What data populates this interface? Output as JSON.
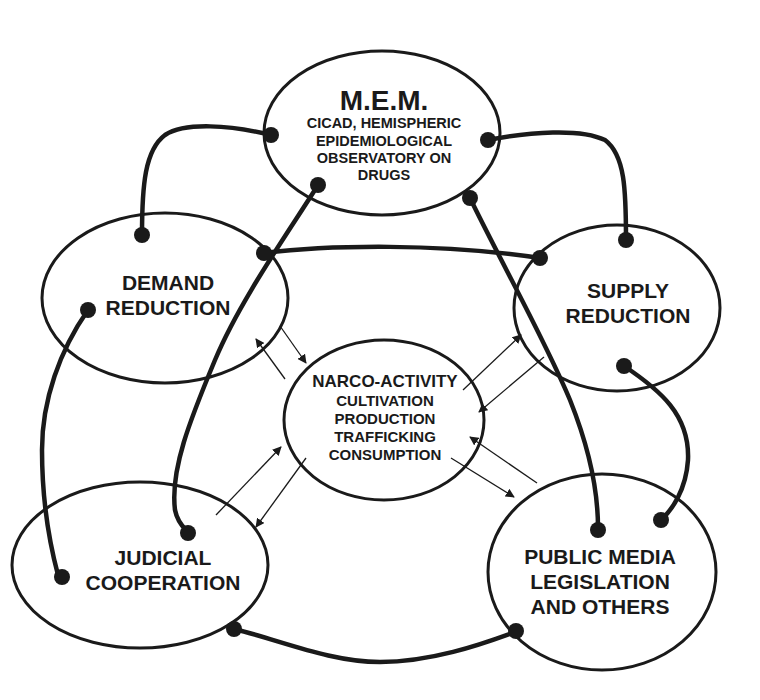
{
  "diagram": {
    "type": "network-of-ellipses",
    "stroke_color": "#1a1a1a",
    "background": "#ffffff",
    "nodes": [
      {
        "id": "mem",
        "title": "M.E.M.",
        "lines": [
          "CICAD, HEMISPHERIC",
          "EPIDEMIOLOGICAL",
          "OBSERVATORY ON",
          "DRUGS"
        ]
      },
      {
        "id": "demand",
        "lines": [
          "DEMAND",
          "REDUCTION"
        ]
      },
      {
        "id": "supply",
        "lines": [
          "SUPPLY",
          "REDUCTION"
        ]
      },
      {
        "id": "narco",
        "title": "NARCO-ACTIVITY",
        "lines": [
          "CULTIVATION",
          "PRODUCTION",
          "TRAFFICKING",
          "CONSUMPTION"
        ]
      },
      {
        "id": "judicial",
        "lines": [
          "JUDICIAL",
          "COOPERATION"
        ]
      },
      {
        "id": "public",
        "lines": [
          "PUBLIC MEDIA",
          "LEGISLATION",
          "AND OTHERS"
        ]
      }
    ],
    "connections": [
      {
        "from": "mem",
        "to": "demand",
        "style": "thick-dot-ends"
      },
      {
        "from": "mem",
        "to": "supply",
        "style": "thick-dot-ends"
      },
      {
        "from": "mem",
        "to": "judicial",
        "style": "thick-dot-ends"
      },
      {
        "from": "mem",
        "to": "public",
        "style": "thick-dot-ends"
      },
      {
        "from": "demand",
        "to": "supply",
        "style": "thick-dot-ends"
      },
      {
        "from": "demand",
        "to": "judicial",
        "style": "thick-dot-ends"
      },
      {
        "from": "supply",
        "to": "public",
        "style": "thick-dot-ends"
      },
      {
        "from": "judicial",
        "to": "public",
        "style": "thick-dot-ends"
      }
    ],
    "flows": [
      {
        "from": "narco",
        "to": "demand",
        "style": "thin-arrow"
      },
      {
        "from": "demand",
        "to": "narco",
        "style": "thin-arrow"
      },
      {
        "from": "narco",
        "to": "supply",
        "style": "thin-arrow"
      },
      {
        "from": "supply",
        "to": "narco",
        "style": "thin-arrow"
      },
      {
        "from": "narco",
        "to": "judicial",
        "style": "thin-arrow"
      },
      {
        "from": "judicial",
        "to": "narco",
        "style": "thin-arrow"
      },
      {
        "from": "narco",
        "to": "public",
        "style": "thin-arrow"
      },
      {
        "from": "public",
        "to": "narco",
        "style": "thin-arrow"
      }
    ]
  }
}
